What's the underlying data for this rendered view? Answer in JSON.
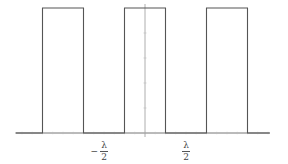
{
  "chart_data": {
    "type": "line",
    "title": "",
    "xlabel": "",
    "ylabel": "",
    "x_units": "lambda",
    "xlim": [
      -1.58,
      1.52
    ],
    "ylim": [
      0,
      1
    ],
    "grid": false,
    "legend": null,
    "x": [
      -1.58,
      -1.25,
      -1.25,
      -0.75,
      -0.75,
      -0.25,
      -0.25,
      0.25,
      0.25,
      0.75,
      0.75,
      1.25,
      1.25,
      1.52
    ],
    "y": [
      0,
      0,
      1,
      1,
      0,
      0,
      1,
      1,
      0,
      0,
      1,
      1,
      0,
      0
    ],
    "pulses": [
      {
        "start": -1.25,
        "end": -0.75,
        "height": 1
      },
      {
        "start": -0.25,
        "end": 0.25,
        "height": 1
      },
      {
        "start": 0.75,
        "end": 1.25,
        "height": 1
      }
    ],
    "tick_labels": [
      {
        "x": -0.5,
        "label": "−λ/2"
      },
      {
        "x": 0.5,
        "label": "λ/2"
      }
    ],
    "line_color": "#555555"
  },
  "labels": {
    "neg_half": {
      "sign": "−",
      "num": "λ",
      "den": "2"
    },
    "pos_half": {
      "num": "λ",
      "den": "2"
    }
  },
  "layout": {
    "origin_px": [
      145,
      133
    ],
    "lambda_px": 82,
    "height_px": 125,
    "axis_x_range_px": [
      16,
      270
    ],
    "axis_y_range_px": [
      4,
      137
    ]
  }
}
